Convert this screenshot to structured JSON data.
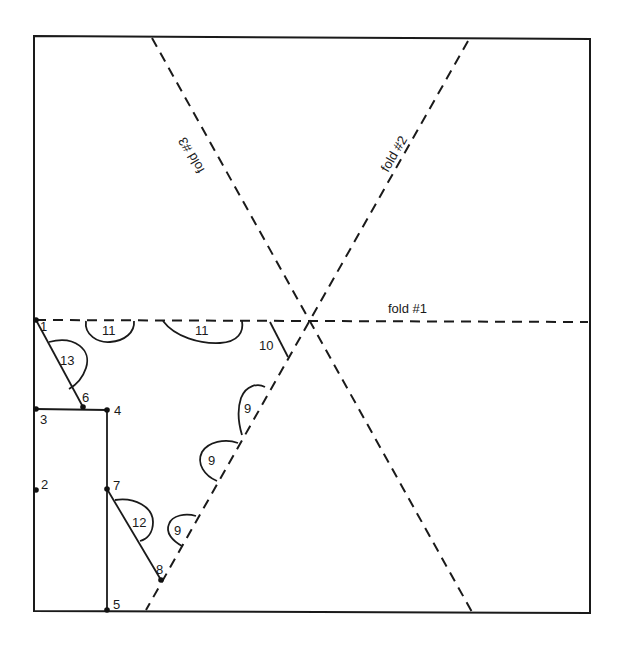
{
  "diagram": {
    "type": "folding-pattern",
    "background": "#ffffff",
    "ink": "#1a1a1a",
    "sheet": {
      "x1": 34,
      "y1": 37,
      "x2": 590,
      "y2": 612
    },
    "folds": [
      {
        "id": "fold1",
        "label": "fold #1",
        "x1": 34,
        "y1": 320,
        "x2": 590,
        "y2": 322
      },
      {
        "id": "fold2",
        "label": "fold #2",
        "x1": 468,
        "y1": 40,
        "x2": 146,
        "y2": 610
      },
      {
        "id": "fold3",
        "label": "fold #3",
        "x1": 152,
        "y1": 38,
        "x2": 472,
        "y2": 612
      }
    ],
    "points": [
      {
        "label": "1",
        "x": 36,
        "y": 320
      },
      {
        "label": "2",
        "x": 36,
        "y": 490
      },
      {
        "label": "3",
        "x": 36,
        "y": 409
      },
      {
        "label": "4",
        "x": 107,
        "y": 410
      },
      {
        "label": "5",
        "x": 107,
        "y": 610
      },
      {
        "label": "6",
        "x": 83,
        "y": 407
      },
      {
        "label": "7",
        "x": 107,
        "y": 489
      },
      {
        "label": "8",
        "x": 161,
        "y": 580
      }
    ],
    "step_marks": [
      {
        "label": "9",
        "kind": "arc"
      },
      {
        "label": "9",
        "kind": "arc"
      },
      {
        "label": "9",
        "kind": "arc"
      },
      {
        "label": "10",
        "kind": "line"
      },
      {
        "label": "11",
        "kind": "arc"
      },
      {
        "label": "11",
        "kind": "arc"
      },
      {
        "label": "12",
        "kind": "arc"
      },
      {
        "label": "13",
        "kind": "arc"
      }
    ]
  },
  "labels": {
    "fold1": "fold #1",
    "fold2": "fold #2",
    "fold3": "fold #3",
    "p1": "1",
    "p2": "2",
    "p3": "3",
    "p4": "4",
    "p5": "5",
    "p6": "6",
    "p7": "7",
    "p8": "8",
    "s9a": "9",
    "s9b": "9",
    "s9c": "9",
    "s10": "10",
    "s11a": "11",
    "s11b": "11",
    "s12": "12",
    "s13": "13"
  }
}
